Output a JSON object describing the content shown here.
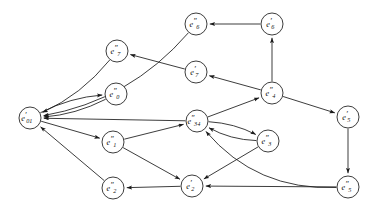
{
  "diagram": {
    "type": "directed-graph",
    "background_color": "#ffffff",
    "stroke_color": "#1a1a1a",
    "node_fill": "#ffffff",
    "node_radius": 11,
    "nodes": [
      {
        "id": "e01p",
        "base": "e",
        "prime": "′",
        "sub": "01",
        "label": "e′01",
        "x": 30,
        "y": 118
      },
      {
        "id": "e0pp",
        "base": "e",
        "prime": "″",
        "sub": "0",
        "label": "e″0",
        "x": 116,
        "y": 94
      },
      {
        "id": "e1pp",
        "base": "e",
        "prime": "″",
        "sub": "1",
        "label": "e″1",
        "x": 113,
        "y": 142
      },
      {
        "id": "e2pp",
        "base": "e",
        "prime": "″",
        "sub": "2",
        "label": "e″2",
        "x": 113,
        "y": 188
      },
      {
        "id": "e2p",
        "base": "e",
        "prime": "′",
        "sub": "2",
        "label": "e′2",
        "x": 192,
        "y": 186
      },
      {
        "id": "e34pp",
        "base": "e",
        "prime": "″",
        "sub": "34",
        "label": "e″34",
        "x": 197,
        "y": 121
      },
      {
        "id": "e3pp",
        "base": "e",
        "prime": "″",
        "sub": "3",
        "label": "e″3",
        "x": 268,
        "y": 141
      },
      {
        "id": "e4pp",
        "base": "e",
        "prime": "″",
        "sub": "4",
        "label": "e″4",
        "x": 272,
        "y": 93
      },
      {
        "id": "e5p",
        "base": "e",
        "prime": "′",
        "sub": "5",
        "label": "e′5",
        "x": 348,
        "y": 117
      },
      {
        "id": "e5pp",
        "base": "e",
        "prime": "″",
        "sub": "5",
        "label": "e″5",
        "x": 348,
        "y": 187
      },
      {
        "id": "e6p",
        "base": "e",
        "prime": "′",
        "sub": "6",
        "label": "e′6",
        "x": 272,
        "y": 24
      },
      {
        "id": "e6pp",
        "base": "e",
        "prime": "″",
        "sub": "6",
        "label": "e″6",
        "x": 196,
        "y": 24
      },
      {
        "id": "e7p",
        "base": "e",
        "prime": "′",
        "sub": "7",
        "label": "e′7",
        "x": 196,
        "y": 72
      },
      {
        "id": "e7pp",
        "base": "e",
        "prime": "″",
        "sub": "7",
        "label": "e″7",
        "x": 117,
        "y": 51
      }
    ],
    "edges": [
      {
        "from": "e6pp",
        "to": "e01p",
        "style": "curved"
      },
      {
        "from": "e7pp",
        "to": "e01p",
        "style": "curved"
      },
      {
        "from": "e01p",
        "to": "e0pp",
        "style": "curved"
      },
      {
        "from": "e0pp",
        "to": "e01p",
        "style": "curved"
      },
      {
        "from": "e01p",
        "to": "e1pp",
        "style": "straight"
      },
      {
        "from": "e1pp",
        "to": "e34pp",
        "style": "straight"
      },
      {
        "from": "e1pp",
        "to": "e2p",
        "style": "straight"
      },
      {
        "from": "e2p",
        "to": "e2pp",
        "style": "straight"
      },
      {
        "from": "e2pp",
        "to": "e01p",
        "style": "straight"
      },
      {
        "from": "e34pp",
        "to": "e3pp",
        "style": "curved"
      },
      {
        "from": "e3pp",
        "to": "e34pp",
        "style": "curved"
      },
      {
        "from": "e3pp",
        "to": "e2p",
        "style": "straight"
      },
      {
        "from": "e34pp",
        "to": "e4pp",
        "style": "straight"
      },
      {
        "from": "e4pp",
        "to": "e7p",
        "style": "straight"
      },
      {
        "from": "e7p",
        "to": "e7pp",
        "style": "straight"
      },
      {
        "from": "e4pp",
        "to": "e6p",
        "style": "straight"
      },
      {
        "from": "e6p",
        "to": "e6pp",
        "style": "straight"
      },
      {
        "from": "e4pp",
        "to": "e5p",
        "style": "straight"
      },
      {
        "from": "e5p",
        "to": "e5pp",
        "style": "straight"
      },
      {
        "from": "e5pp",
        "to": "e2p",
        "style": "straight"
      },
      {
        "from": "e5pp",
        "to": "e34pp",
        "style": "curved"
      },
      {
        "from": "e34pp",
        "to": "e01p",
        "style": "straight"
      }
    ]
  }
}
